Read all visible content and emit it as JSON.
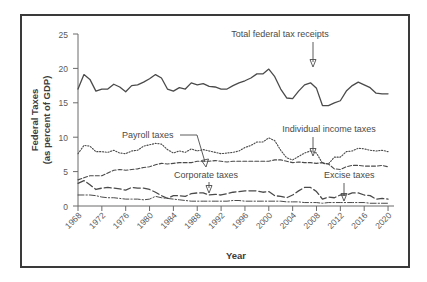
{
  "chart_data": {
    "type": "line",
    "title": "",
    "xlabel": "Year",
    "ylabel": "Federal Taxes (as percent of GDP)",
    "ylabel_line1": "Federal Taxes",
    "ylabel_line2": "(as percent of GDP)",
    "xlim": [
      1968,
      2021
    ],
    "ylim": [
      0,
      25
    ],
    "yticks": [
      0,
      5,
      10,
      15,
      20,
      25
    ],
    "xticks": [
      1968,
      1972,
      1976,
      1980,
      1984,
      1988,
      1992,
      1996,
      2000,
      2004,
      2008,
      2012,
      2016,
      2020
    ],
    "grid": false,
    "legend": "none",
    "x": [
      1968,
      1969,
      1970,
      1971,
      1972,
      1973,
      1974,
      1975,
      1976,
      1977,
      1978,
      1979,
      1980,
      1981,
      1982,
      1983,
      1984,
      1985,
      1986,
      1987,
      1988,
      1989,
      1990,
      1991,
      1992,
      1993,
      1994,
      1995,
      1996,
      1997,
      1998,
      1999,
      2000,
      2001,
      2002,
      2003,
      2004,
      2005,
      2006,
      2007,
      2008,
      2009,
      2010,
      2011,
      2012,
      2013,
      2014,
      2015,
      2016,
      2017,
      2018,
      2019,
      2020
    ],
    "series": [
      {
        "name": "Total federal tax receipts",
        "style": "solid",
        "color": "#4a4a4a",
        "values": [
          17.0,
          19.1,
          18.4,
          16.7,
          17.0,
          17.0,
          17.7,
          17.3,
          16.6,
          17.5,
          17.6,
          18.0,
          18.5,
          19.1,
          18.6,
          17.0,
          16.7,
          17.2,
          17.0,
          17.9,
          17.6,
          17.8,
          17.4,
          17.3,
          17.0,
          17.0,
          17.5,
          17.9,
          18.2,
          18.6,
          19.2,
          19.2,
          19.9,
          18.8,
          17.0,
          15.7,
          15.6,
          16.7,
          17.6,
          17.9,
          17.1,
          14.6,
          14.6,
          15.0,
          15.3,
          16.7,
          17.5,
          18.0,
          17.6,
          17.2,
          16.4,
          16.3,
          16.3
        ]
      },
      {
        "name": "Individual income taxes",
        "style": "dotted",
        "color": "#5a5a5a",
        "values": [
          7.6,
          8.8,
          8.7,
          7.9,
          7.9,
          7.8,
          8.1,
          7.7,
          7.6,
          8.0,
          8.1,
          8.7,
          8.9,
          9.1,
          9.0,
          8.2,
          7.7,
          8.0,
          7.8,
          8.3,
          8.0,
          8.2,
          8.0,
          7.8,
          7.6,
          7.7,
          7.8,
          8.0,
          8.5,
          8.8,
          9.3,
          9.3,
          9.9,
          9.5,
          8.1,
          7.0,
          6.7,
          7.2,
          7.7,
          8.0,
          7.7,
          6.2,
          6.1,
          7.1,
          7.1,
          7.9,
          8.0,
          8.4,
          8.3,
          8.1,
          8.0,
          8.1,
          7.9
        ]
      },
      {
        "name": "Payroll taxes",
        "style": "dashed",
        "color": "#4a4a4a",
        "values": [
          3.8,
          4.1,
          4.4,
          4.4,
          4.4,
          4.8,
          5.2,
          5.3,
          5.2,
          5.3,
          5.4,
          5.6,
          5.7,
          6.0,
          6.2,
          6.1,
          6.2,
          6.3,
          6.3,
          6.3,
          6.5,
          6.5,
          6.5,
          6.6,
          6.5,
          6.4,
          6.5,
          6.5,
          6.5,
          6.5,
          6.5,
          6.5,
          6.5,
          6.7,
          6.7,
          6.5,
          6.3,
          6.4,
          6.3,
          6.3,
          6.2,
          6.3,
          6.1,
          5.4,
          5.3,
          5.7,
          5.9,
          5.9,
          5.8,
          5.8,
          5.8,
          5.9,
          5.7
        ]
      },
      {
        "name": "Corporate taxes",
        "style": "longdash",
        "color": "#4a4a4a",
        "values": [
          3.3,
          3.7,
          3.1,
          2.4,
          2.6,
          2.7,
          2.6,
          2.5,
          2.3,
          2.7,
          2.6,
          2.6,
          2.4,
          2.0,
          1.5,
          1.1,
          1.5,
          1.5,
          1.4,
          1.8,
          1.9,
          1.9,
          1.6,
          1.7,
          1.6,
          1.8,
          2.0,
          2.1,
          2.2,
          2.2,
          2.2,
          2.0,
          2.1,
          1.5,
          1.4,
          1.2,
          1.6,
          2.2,
          2.7,
          2.7,
          2.1,
          1.0,
          1.3,
          1.2,
          1.6,
          1.6,
          1.9,
          1.9,
          1.6,
          1.5,
          1.0,
          1.1,
          1.0
        ]
      },
      {
        "name": "Excise taxes",
        "style": "dashdot",
        "color": "#6a6a6a",
        "values": [
          1.6,
          1.6,
          1.6,
          1.5,
          1.3,
          1.2,
          1.2,
          1.1,
          1.0,
          1.0,
          1.0,
          0.9,
          1.0,
          1.4,
          1.2,
          1.1,
          1.0,
          0.9,
          0.8,
          0.7,
          0.7,
          0.7,
          0.7,
          0.7,
          0.7,
          0.7,
          0.8,
          0.8,
          0.7,
          0.7,
          0.7,
          0.7,
          0.7,
          0.7,
          0.7,
          0.6,
          0.6,
          0.6,
          0.5,
          0.5,
          0.5,
          0.4,
          0.5,
          0.5,
          0.5,
          0.5,
          0.5,
          0.5,
          0.5,
          0.4,
          0.4,
          0.4,
          0.4
        ]
      }
    ],
    "annotations": [
      {
        "id": "total-federal-tax-receipts",
        "label": "Total federal tax receipts",
        "marker": "arrow-down"
      },
      {
        "id": "individual-income-taxes",
        "label": "Individual income taxes",
        "marker": "arrow-down"
      },
      {
        "id": "payroll-taxes",
        "label": "Payroll taxes",
        "marker": "leader-line"
      },
      {
        "id": "corporate-taxes",
        "label": "Corporate taxes",
        "marker": "arrow-down"
      },
      {
        "id": "excise-taxes",
        "label": "Excise taxes",
        "marker": "arrow-down"
      }
    ]
  }
}
